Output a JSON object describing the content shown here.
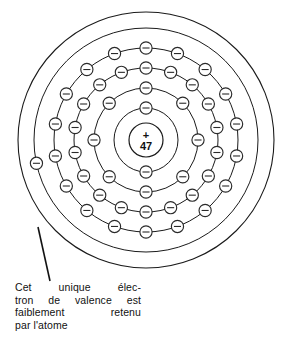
{
  "figure": {
    "nucleus": {
      "charge_sign": "+",
      "proton_number": "47"
    },
    "geometry": {
      "center_x": 146,
      "center_y": 140,
      "nucleus_radius": 17,
      "boundary_radius": 128,
      "electron_radius": 6.1
    },
    "colors": {
      "stroke": "#1a1a1a",
      "electron_stroke": "#2a2a2a",
      "background": "#ffffff",
      "text": "#111111"
    },
    "shells": [
      {
        "name": "K",
        "radius": 32,
        "electron_count": 2,
        "start_angle_deg": -90
      },
      {
        "name": "L",
        "radius": 52,
        "electron_count": 8,
        "start_angle_deg": -90
      },
      {
        "name": "M",
        "radius": 72,
        "electron_count": 18,
        "start_angle_deg": -90
      },
      {
        "name": "N",
        "radius": 92,
        "electron_count": 18,
        "start_angle_deg": -90
      },
      {
        "name": "O",
        "radius": 112,
        "electron_count": 1,
        "start_angle_deg": 168
      }
    ],
    "boundary": {
      "radius": 128,
      "label": "atom-outer-boundary"
    },
    "leader": {
      "from_x": 38,
      "from_y": 227,
      "to_x": 50,
      "to_y": 281
    }
  },
  "caption": {
    "lines": [
      {
        "words": [
          "Cet",
          "unique",
          "élec-"
        ],
        "justify": true
      },
      {
        "words": [
          "tron",
          "de",
          "valence",
          "est"
        ],
        "justify": true
      },
      {
        "words": [
          "faiblement",
          "retenu"
        ],
        "justify": true
      },
      {
        "words": [
          "par l'atome"
        ],
        "justify": false
      }
    ],
    "full_text": "Cet unique électron de valence est faiblement retenu par l'atome"
  },
  "chart_data": {
    "type": "diagram",
    "element_symbol_implied": "Ag",
    "atomic_number": 47,
    "shell_names": [
      "K",
      "L",
      "M",
      "N",
      "O"
    ],
    "shell_occupancy": [
      2,
      8,
      18,
      18,
      1
    ],
    "total_electrons": 47,
    "annotation": "Cet unique électron de valence est faiblement retenu par l'atome",
    "legend": [],
    "grid": false
  }
}
